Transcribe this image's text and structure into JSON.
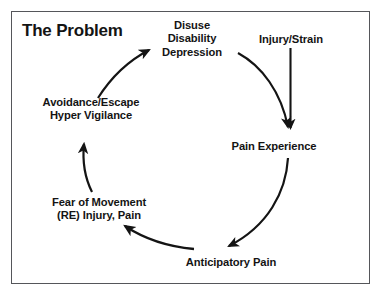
{
  "diagram": {
    "title": "The Problem",
    "type": "cycle",
    "direction": "clockwise",
    "frame_color": "#55565a",
    "text_color": "#141414",
    "background": "#ffffff",
    "nodes": [
      {
        "id": "disuse",
        "name": "disuse-disability-depression",
        "lines": [
          "Disuse",
          "Disability",
          "Depression"
        ],
        "position": "top"
      },
      {
        "id": "injury",
        "name": "injury-strain",
        "lines": [
          "Injury/Strain"
        ],
        "position": "top-right-entry"
      },
      {
        "id": "pain-experience",
        "name": "pain-experience",
        "lines": [
          "Pain Experience"
        ],
        "position": "right"
      },
      {
        "id": "anticipatory-pain",
        "name": "anticipatory-pain",
        "lines": [
          "Anticipatory Pain"
        ],
        "position": "bottom"
      },
      {
        "id": "fear-of-movement",
        "name": "fear-of-movement",
        "lines": [
          "Fear of Movement",
          "(RE) Injury, Pain"
        ],
        "position": "bottom-left"
      },
      {
        "id": "avoidance",
        "name": "avoidance-escape-hyper-vigilance",
        "lines": [
          "Avoidance/Escape",
          "Hyper Vigilance"
        ],
        "position": "top-left"
      }
    ],
    "arrows": [
      {
        "name": "arrow-injury-to-pain-experience",
        "from": "injury",
        "to": "pain-experience",
        "style": "straight-vertical"
      },
      {
        "name": "arrow-disuse-to-pain-experience",
        "from": "disuse",
        "to": "pain-experience",
        "style": "curved"
      },
      {
        "name": "arrow-pain-experience-to-anticipatory-pain",
        "from": "pain-experience",
        "to": "anticipatory-pain",
        "style": "curved"
      },
      {
        "name": "arrow-anticipatory-pain-to-fear-of-movement",
        "from": "anticipatory-pain",
        "to": "fear-of-movement",
        "style": "curved"
      },
      {
        "name": "arrow-fear-of-movement-to-avoidance",
        "from": "fear-of-movement",
        "to": "avoidance",
        "style": "curved-vertical"
      },
      {
        "name": "arrow-avoidance-to-disuse",
        "from": "avoidance",
        "to": "disuse",
        "style": "curved"
      }
    ]
  }
}
